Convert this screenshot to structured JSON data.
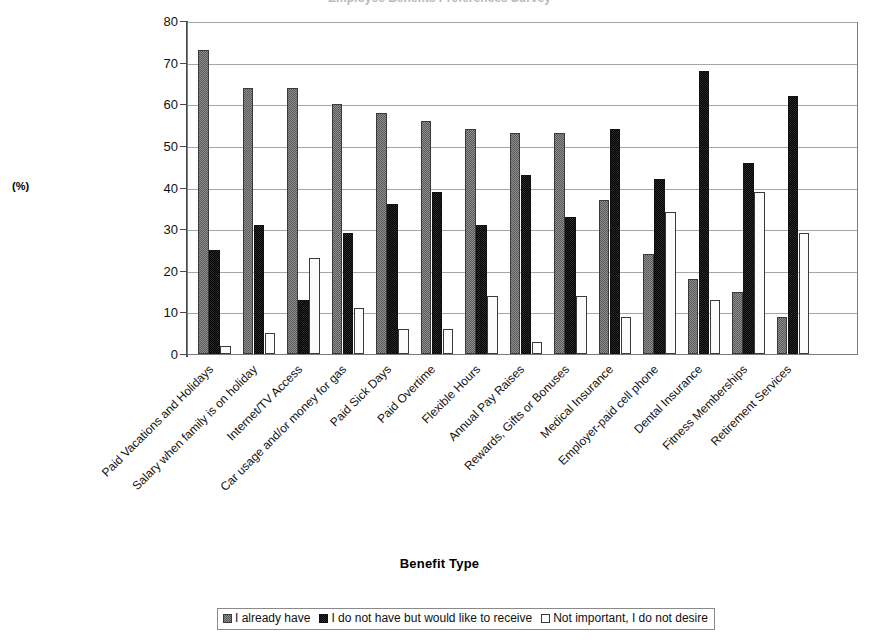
{
  "chart": {
    "title": "Employee Benefits Preferences Survey",
    "x_title": "Benefit Type",
    "y_unit": "(%)"
  },
  "chart_data": {
    "type": "bar",
    "title": "Employee Benefits Preferences Survey",
    "xlabel": "Benefit Type",
    "ylabel": "(%)",
    "ylim": [
      0,
      80
    ],
    "yticks": [
      0,
      10,
      20,
      30,
      40,
      50,
      60,
      70,
      80
    ],
    "grid": true,
    "legend_position": "bottom",
    "categories": [
      "Paid Vacations and Holidays",
      "Salary when family is on holiday",
      "Internet/TV Access",
      "Car usage and/or money for gas",
      "Paid Sick Days",
      "Paid Overtime",
      "Flexible Hours",
      "Annual Pay Raises",
      "Rewards, Gifts or Bonuses",
      "Medical Insurance",
      "Employer-paid cell phone",
      "Dental Insurance",
      "Fitness Memberships",
      "Retirement Services"
    ],
    "series": [
      {
        "name": "I already have",
        "values": [
          73,
          64,
          64,
          60,
          58,
          56,
          54,
          53,
          53,
          37,
          24,
          18,
          15,
          9
        ]
      },
      {
        "name": "I do not have but would like to receive",
        "values": [
          25,
          31,
          13,
          29,
          36,
          39,
          31,
          43,
          33,
          54,
          42,
          68,
          46,
          62
        ]
      },
      {
        "name": "Not important, I do not desire",
        "values": [
          2,
          5,
          23,
          11,
          6,
          6,
          14,
          3,
          14,
          9,
          34,
          13,
          39,
          29
        ]
      }
    ]
  },
  "legend": {
    "items": [
      {
        "label": "I already have",
        "marker": "hatched-gray-swatch"
      },
      {
        "label": "I do not have but would like to receive",
        "marker": "solid-dark-swatch"
      },
      {
        "label": "Not important, I do not desire",
        "marker": "white-swatch"
      }
    ]
  }
}
